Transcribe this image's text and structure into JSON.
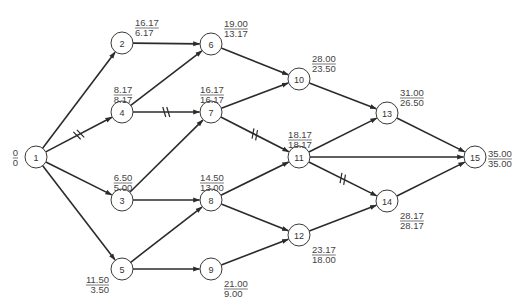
{
  "diagram": {
    "type": "activity-on-node network (PERT/CPM)",
    "nodes": [
      {
        "id": "1",
        "x": 36,
        "y": 157,
        "top": "0",
        "bottom": "0",
        "label_pos": "left"
      },
      {
        "id": "2",
        "x": 122,
        "y": 43,
        "top": "16.17",
        "bottom": "6.17",
        "label_pos": "upper-right"
      },
      {
        "id": "3",
        "x": 122,
        "y": 200,
        "top": "6.50",
        "bottom": "5.00",
        "label_pos": "above"
      },
      {
        "id": "4",
        "x": 122,
        "y": 112,
        "top": "8.17",
        "bottom": "8.17",
        "label_pos": "above"
      },
      {
        "id": "5",
        "x": 122,
        "y": 269,
        "top": "11.50",
        "bottom": "3.50",
        "label_pos": "lower-left"
      },
      {
        "id": "6",
        "x": 211,
        "y": 44,
        "top": "19.00",
        "bottom": "13.17",
        "label_pos": "upper-right"
      },
      {
        "id": "7",
        "x": 211,
        "y": 112,
        "top": "16.17",
        "bottom": "16.17",
        "label_pos": "above"
      },
      {
        "id": "8",
        "x": 211,
        "y": 200,
        "top": "14.50",
        "bottom": "13.00",
        "label_pos": "above"
      },
      {
        "id": "9",
        "x": 211,
        "y": 269,
        "top": "21.00",
        "bottom": "9.00",
        "label_pos": "lower-right"
      },
      {
        "id": "10",
        "x": 299,
        "y": 79,
        "top": "28.00",
        "bottom": "23.50",
        "label_pos": "upper-right"
      },
      {
        "id": "11",
        "x": 299,
        "y": 157,
        "top": "18.17",
        "bottom": "18.17",
        "label_pos": "above"
      },
      {
        "id": "12",
        "x": 299,
        "y": 235,
        "top": "23.17",
        "bottom": "18.00",
        "label_pos": "lower-right"
      },
      {
        "id": "13",
        "x": 387,
        "y": 113,
        "top": "31.00",
        "bottom": "26.50",
        "label_pos": "upper-right"
      },
      {
        "id": "14",
        "x": 387,
        "y": 201,
        "top": "28.17",
        "bottom": "28.17",
        "label_pos": "lower-right"
      },
      {
        "id": "15",
        "x": 475,
        "y": 157,
        "top": "35.00",
        "bottom": "35.00",
        "label_pos": "right"
      }
    ],
    "edges": [
      {
        "from": "1",
        "to": "2",
        "critical": false
      },
      {
        "from": "1",
        "to": "4",
        "critical": true
      },
      {
        "from": "1",
        "to": "3",
        "critical": false
      },
      {
        "from": "1",
        "to": "5",
        "critical": false
      },
      {
        "from": "2",
        "to": "6",
        "critical": false
      },
      {
        "from": "4",
        "to": "6",
        "critical": false
      },
      {
        "from": "4",
        "to": "7",
        "critical": true
      },
      {
        "from": "3",
        "to": "7",
        "critical": false
      },
      {
        "from": "3",
        "to": "8",
        "critical": false
      },
      {
        "from": "5",
        "to": "8",
        "critical": false
      },
      {
        "from": "5",
        "to": "9",
        "critical": false
      },
      {
        "from": "6",
        "to": "10",
        "critical": false
      },
      {
        "from": "7",
        "to": "10",
        "critical": false
      },
      {
        "from": "7",
        "to": "11",
        "critical": true
      },
      {
        "from": "8",
        "to": "11",
        "critical": false
      },
      {
        "from": "8",
        "to": "12",
        "critical": false
      },
      {
        "from": "9",
        "to": "12",
        "critical": false
      },
      {
        "from": "10",
        "to": "13",
        "critical": false
      },
      {
        "from": "11",
        "to": "13",
        "critical": false
      },
      {
        "from": "11",
        "to": "15",
        "critical": false
      },
      {
        "from": "11",
        "to": "14",
        "critical": true
      },
      {
        "from": "12",
        "to": "14",
        "critical": false
      },
      {
        "from": "13",
        "to": "15",
        "critical": false
      },
      {
        "from": "14",
        "to": "15",
        "critical": false
      }
    ],
    "node_radius": 11,
    "line_color": "#2b2b2b"
  }
}
